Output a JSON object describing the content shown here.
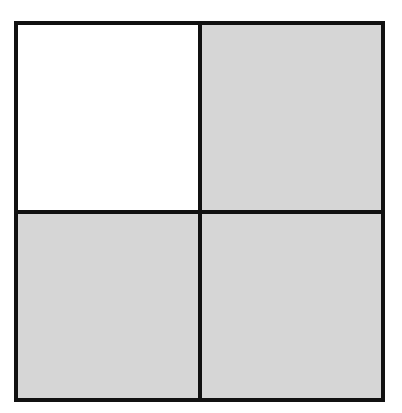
{
  "diagram": {
    "type": "fraction-grid",
    "rows": 2,
    "columns": 2,
    "border_color": "#111111",
    "cells": [
      {
        "row": 0,
        "col": 0,
        "shaded": false,
        "color": "#ffffff"
      },
      {
        "row": 0,
        "col": 1,
        "shaded": true,
        "color": "#d6d6d6"
      },
      {
        "row": 1,
        "col": 0,
        "shaded": true,
        "color": "#d6d6d6"
      },
      {
        "row": 1,
        "col": 1,
        "shaded": true,
        "color": "#d6d6d6"
      }
    ],
    "shaded_count": 3,
    "total_count": 4
  }
}
